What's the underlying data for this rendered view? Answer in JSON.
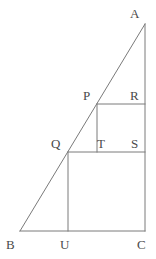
{
  "figure": {
    "type": "geometry-diagram",
    "width": 156,
    "height": 259,
    "background_color": "#ffffff",
    "stroke_color": "#7a7a7a",
    "label_color": "#4a4a4a",
    "stroke_width": 1,
    "points": {
      "A": {
        "label": "A",
        "x": 145,
        "y": 24,
        "label_x": 130,
        "label_y": 7
      },
      "B": {
        "label": "B",
        "x": 20,
        "y": 231,
        "label_x": 6,
        "label_y": 238
      },
      "C": {
        "label": "C",
        "x": 145,
        "y": 231,
        "label_x": 137,
        "label_y": 238
      },
      "U": {
        "label": "U",
        "x": 68,
        "y": 231,
        "label_x": 60,
        "label_y": 238
      },
      "Q": {
        "label": "Q",
        "x": 68,
        "y": 152,
        "label_x": 51,
        "label_y": 137
      },
      "S": {
        "label": "S",
        "x": 145,
        "y": 152,
        "label_x": 131,
        "label_y": 137
      },
      "T": {
        "label": "T",
        "x": 97,
        "y": 152,
        "label_x": 97,
        "label_y": 137
      },
      "P": {
        "label": "P",
        "x": 97,
        "y": 104,
        "label_x": 83,
        "label_y": 89
      },
      "R": {
        "label": "R",
        "x": 145,
        "y": 104,
        "label_x": 130,
        "label_y": 89
      }
    },
    "segments": [
      {
        "name": "hypotenuse-AB",
        "x1": 145,
        "y1": 24,
        "x2": 20,
        "y2": 231
      },
      {
        "name": "vertical-AC",
        "x1": 145,
        "y1": 24,
        "x2": 145,
        "y2": 231
      },
      {
        "name": "base-BC",
        "x1": 20,
        "y1": 231,
        "x2": 145,
        "y2": 231
      },
      {
        "name": "square-top-QS",
        "x1": 68,
        "y1": 152,
        "x2": 145,
        "y2": 152
      },
      {
        "name": "square-left-QU",
        "x1": 68,
        "y1": 152,
        "x2": 68,
        "y2": 231
      },
      {
        "name": "small-top-PR",
        "x1": 97,
        "y1": 104,
        "x2": 145,
        "y2": 104
      },
      {
        "name": "small-left-PT",
        "x1": 97,
        "y1": 104,
        "x2": 97,
        "y2": 152
      }
    ],
    "shapes": {
      "triangle": "ABC",
      "large_square": "QUCS",
      "small_square": "PTSR"
    }
  }
}
